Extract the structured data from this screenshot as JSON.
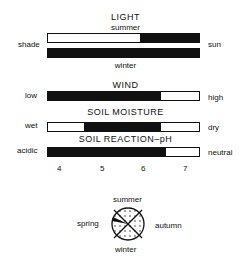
{
  "light": {
    "title": "LIGHT",
    "summer_label": "summer",
    "winter_label": "winter",
    "left_label": "shade",
    "right_label": "sun",
    "summer_black_start_pct": 61,
    "winter_black_start_pct": 0
  },
  "wind": {
    "title": "WIND",
    "left_label": "low",
    "right_label": "high",
    "black_start_pct": 0,
    "black_end_pct": 75
  },
  "soil_moisture": {
    "title": "SOIL MOISTURE",
    "left_label": "wet",
    "right_label": "dry",
    "black_start_pct": 24,
    "black_end_pct": 75
  },
  "soil_ph": {
    "title": "SOIL REACTION–pH",
    "left_label": "acidic",
    "right_label": "neutral",
    "black_start_pct": 0,
    "black_end_pct": 78,
    "ticks": [
      "4",
      "5",
      "6",
      "7"
    ]
  },
  "seasons": {
    "top": "summer",
    "bottom": "winter",
    "left": "spring",
    "right": "autumn"
  }
}
